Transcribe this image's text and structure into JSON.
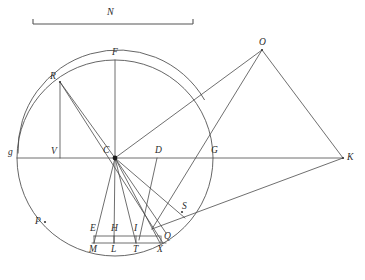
{
  "figure": {
    "width": 365,
    "height": 280,
    "background_color": "#ffffff",
    "ink_color": "#4a4a4a",
    "label_color": "#2b2b2b"
  },
  "scale": {
    "label": "N",
    "x1": 33,
    "x2": 193,
    "y": 24,
    "tick_height": 5,
    "label_x": 110,
    "label_y": 7
  },
  "circle": {
    "center_x": 115,
    "center_y": 158,
    "radius": 98,
    "label": "C"
  },
  "outer_arc": {
    "center_x": 118,
    "center_y": 150,
    "radius": 100,
    "start_angle_deg": 178,
    "end_angle_deg": 330
  },
  "points": [
    {
      "name": "N",
      "label": "N",
      "x": 110,
      "y": 7,
      "lx": -3,
      "ly": 0,
      "role": "scale-label"
    },
    {
      "name": "O",
      "label": "O",
      "x": 262,
      "y": 50,
      "lx": -3,
      "ly": -12,
      "role": "quad-apex"
    },
    {
      "name": "F",
      "label": "F",
      "x": 115,
      "y": 60,
      "lx": -3,
      "ly": -12,
      "role": "circle-top"
    },
    {
      "name": "R",
      "label": "R",
      "x": 60,
      "y": 82,
      "lx": -10,
      "ly": -10,
      "role": "circle-point"
    },
    {
      "name": "V",
      "label": "V",
      "x": 60,
      "y": 158,
      "lx": -9,
      "ly": -11,
      "role": "foot-of-perpendicular"
    },
    {
      "name": "C",
      "label": "C",
      "x": 115,
      "y": 158,
      "lx": -12,
      "ly": -12,
      "role": "center"
    },
    {
      "name": "D",
      "label": "D",
      "x": 157,
      "y": 158,
      "lx": -2,
      "ly": -12,
      "role": "axis-point"
    },
    {
      "name": "G",
      "label": "G",
      "x": 212,
      "y": 158,
      "lx": -1,
      "ly": -12,
      "role": "circle-right"
    },
    {
      "name": "g",
      "label": "g",
      "x": 17,
      "y": 158,
      "lx": -9,
      "ly": -10,
      "role": "circle-left"
    },
    {
      "name": "K",
      "label": "K",
      "x": 343,
      "y": 158,
      "lx": 4,
      "ly": -5,
      "role": "apex-right"
    },
    {
      "name": "P",
      "label": "P",
      "x": 45,
      "y": 222,
      "lx": -10,
      "ly": -5,
      "role": "arc-point"
    },
    {
      "name": "S",
      "label": "S",
      "x": 182,
      "y": 212,
      "lx": 0,
      "ly": -10,
      "role": "arc-intersection"
    },
    {
      "name": "E",
      "label": "E",
      "x": 94,
      "y": 236,
      "lx": -4,
      "ly": -12,
      "role": "inner-rect-left"
    },
    {
      "name": "H",
      "label": "H",
      "x": 114,
      "y": 236,
      "lx": -3,
      "ly": -12,
      "role": "inner-rect-mid"
    },
    {
      "name": "I",
      "label": "I",
      "x": 136,
      "y": 236,
      "lx": -2,
      "ly": -12,
      "role": "inner-rect-right"
    },
    {
      "name": "Q",
      "label": "Q",
      "x": 163,
      "y": 239,
      "lx": 1,
      "ly": -7,
      "role": "rect-corner"
    },
    {
      "name": "M",
      "label": "M",
      "x": 94,
      "y": 243,
      "lx": -5,
      "ly": 2,
      "role": "base-point"
    },
    {
      "name": "L",
      "label": "L",
      "x": 114,
      "y": 243,
      "lx": -3,
      "ly": 2,
      "role": "base-point"
    },
    {
      "name": "T",
      "label": "T",
      "x": 136,
      "y": 243,
      "lx": -3,
      "ly": 2,
      "role": "base-point"
    },
    {
      "name": "X",
      "label": "X",
      "x": 160,
      "y": 243,
      "lx": -3,
      "ly": 2,
      "role": "base-point"
    }
  ],
  "segments": [
    {
      "name": "axis-g-K",
      "x1": 17,
      "y1": 158,
      "x2": 343,
      "y2": 158
    },
    {
      "name": "radius-C-F",
      "x1": 115,
      "y1": 158,
      "x2": 115,
      "y2": 60
    },
    {
      "name": "chord-C-R",
      "x1": 115,
      "y1": 158,
      "x2": 60,
      "y2": 82
    },
    {
      "name": "perp-R-V",
      "x1": 60,
      "y1": 82,
      "x2": 60,
      "y2": 158
    },
    {
      "name": "ray-R-P-X",
      "x1": 60,
      "y1": 82,
      "x2": 163,
      "y2": 243
    },
    {
      "name": "ray-C-M",
      "x1": 115,
      "y1": 158,
      "x2": 94,
      "y2": 243
    },
    {
      "name": "ray-C-L",
      "x1": 115,
      "y1": 158,
      "x2": 114,
      "y2": 243
    },
    {
      "name": "ray-C-T",
      "x1": 115,
      "y1": 158,
      "x2": 136,
      "y2": 243
    },
    {
      "name": "ray-C-X",
      "x1": 115,
      "y1": 158,
      "x2": 160,
      "y2": 243
    },
    {
      "name": "ray-C-Q",
      "x1": 115,
      "y1": 158,
      "x2": 166,
      "y2": 233
    },
    {
      "name": "ray-C-S-O",
      "x1": 115,
      "y1": 158,
      "x2": 262,
      "y2": 50
    },
    {
      "name": "ray-C-Sdown",
      "x1": 115,
      "y1": 158,
      "x2": 185,
      "y2": 218
    },
    {
      "name": "seg-D-T",
      "x1": 157,
      "y1": 158,
      "x2": 139,
      "y2": 240
    },
    {
      "name": "quad-O-K",
      "x1": 262,
      "y1": 50,
      "x2": 343,
      "y2": 158
    },
    {
      "name": "quad-K-S",
      "x1": 343,
      "y1": 158,
      "x2": 152,
      "y2": 229
    },
    {
      "name": "quad-left-O",
      "x1": 152,
      "y1": 229,
      "x2": 262,
      "y2": 50
    },
    {
      "name": "rect-top-E-I",
      "x1": 94,
      "y1": 236,
      "x2": 160,
      "y2": 236
    },
    {
      "name": "rect-bot-M-X",
      "x1": 92,
      "y1": 243,
      "x2": 166,
      "y2": 243
    },
    {
      "name": "rect-side-E-M",
      "x1": 94,
      "y1": 236,
      "x2": 94,
      "y2": 243
    },
    {
      "name": "rect-side-H-L",
      "x1": 114,
      "y1": 236,
      "x2": 114,
      "y2": 243
    },
    {
      "name": "rect-side-I-T",
      "x1": 136,
      "y1": 236,
      "x2": 136,
      "y2": 243
    },
    {
      "name": "rect-side-Q-X",
      "x1": 161,
      "y1": 236,
      "x2": 161,
      "y2": 243
    }
  ]
}
